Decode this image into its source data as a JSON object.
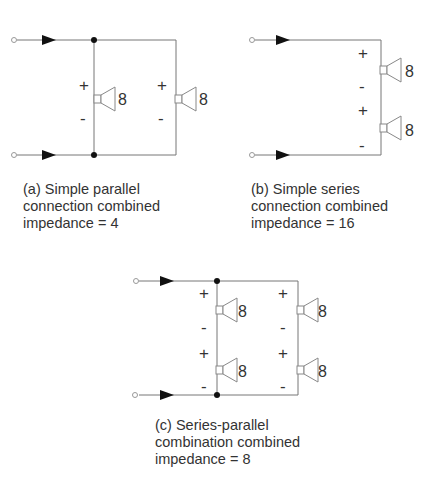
{
  "figure": {
    "diagrams": [
      {
        "id": "a",
        "caption_lines": [
          "(a) Simple parallel",
          "connection combined",
          "impedance = 4"
        ],
        "speakers": [
          {
            "impedance": "8",
            "plus": "+",
            "minus": "-"
          },
          {
            "impedance": "8",
            "plus": "+",
            "minus": "-"
          }
        ]
      },
      {
        "id": "b",
        "caption_lines": [
          "(b) Simple series",
          "connection combined",
          "impedance = 16"
        ],
        "speakers": [
          {
            "impedance": "8",
            "plus": "+",
            "minus": "-"
          },
          {
            "impedance": "8",
            "plus": "+",
            "minus": "-"
          }
        ]
      },
      {
        "id": "c",
        "caption_lines": [
          "(c) Series-parallel",
          "combination combined",
          "impedance = 8"
        ],
        "speakers": [
          {
            "impedance": "8",
            "plus": "+",
            "minus": "-"
          },
          {
            "impedance": "8",
            "plus": "+",
            "minus": "-"
          },
          {
            "impedance": "8",
            "plus": "+",
            "minus": "-"
          },
          {
            "impedance": "8",
            "plus": "+",
            "minus": "-"
          }
        ]
      }
    ],
    "colors": {
      "wire": "#777777",
      "arrow": "#111111",
      "text": "#333333",
      "speaker": "#888888"
    }
  }
}
